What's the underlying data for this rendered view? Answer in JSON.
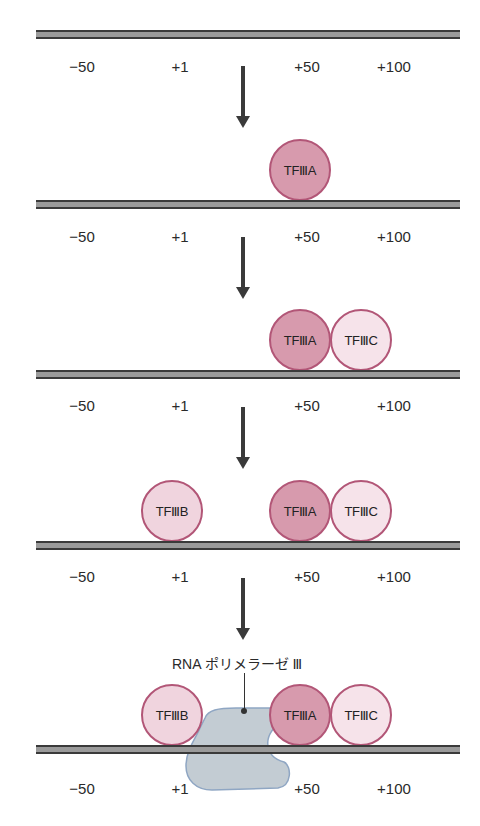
{
  "figure": {
    "positions": [
      "−50",
      "+1",
      "+50",
      "+100"
    ],
    "colors": {
      "dna_fill": "#9a9a9a",
      "dna_edge": "#3a3a3a",
      "factor_border": "#b25677",
      "tfiiia_fill": "#d79aad",
      "tfiiic_fill": "#f6e3ea",
      "tfiiib_fill": "#f0d4de",
      "polymerase_fill": "#c3ccd3",
      "polymerase_edge": "#8fa6c3"
    },
    "factors": {
      "tfiiia": "TFⅢA",
      "tfiiib": "TFⅢB",
      "tfiiic": "TFⅢC"
    },
    "polymerase_label": "RNA ポリメラーゼ Ⅲ",
    "steps": [
      {
        "step": 1,
        "bound": []
      },
      {
        "step": 2,
        "bound": [
          "TFIIIA"
        ]
      },
      {
        "step": 3,
        "bound": [
          "TFIIIA",
          "TFIIIC"
        ]
      },
      {
        "step": 4,
        "bound": [
          "TFIIIB",
          "TFIIIA",
          "TFIIIC"
        ]
      },
      {
        "step": 5,
        "bound": [
          "TFIIIB",
          "RNA polymerase III",
          "TFIIIA",
          "TFIIIC"
        ]
      }
    ]
  }
}
